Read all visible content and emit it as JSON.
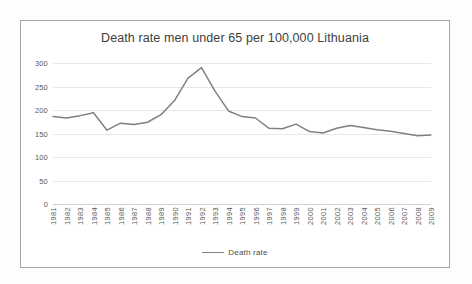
{
  "chart_data": {
    "type": "line",
    "title": "Death rate men under 65 per 100,000 Lithuania",
    "xlabel": "",
    "ylabel": "",
    "ylim": [
      0,
      300
    ],
    "yticks": [
      0,
      50,
      100,
      150,
      200,
      250,
      300
    ],
    "grid": true,
    "legend_position": "bottom",
    "line_color": "#808080",
    "categories": [
      "1981",
      "1982",
      "1983",
      "1984",
      "1985",
      "1986",
      "1987",
      "1988",
      "1989",
      "1990",
      "1991",
      "1992",
      "1993",
      "1994",
      "1995",
      "1996",
      "1997",
      "1998",
      "1999",
      "2000",
      "2001",
      "2002",
      "2003",
      "2004",
      "2005",
      "2006",
      "2007",
      "2008",
      "2009"
    ],
    "series": [
      {
        "name": "Death rate",
        "values": [
          186,
          183,
          188,
          194,
          157,
          172,
          169,
          174,
          190,
          220,
          268,
          290,
          240,
          198,
          186,
          183,
          161,
          160,
          170,
          154,
          151,
          161,
          167,
          163,
          158,
          155,
          150,
          145,
          147
        ]
      }
    ]
  },
  "legend": {
    "items": [
      {
        "label": "Death rate",
        "color": "#808080"
      }
    ]
  },
  "colors": {
    "line": "#808080",
    "gridline": "#e8e8e8",
    "frame": "#a6a6a6",
    "text": "#595959",
    "title_text": "#404040",
    "background": "#ffffff"
  }
}
